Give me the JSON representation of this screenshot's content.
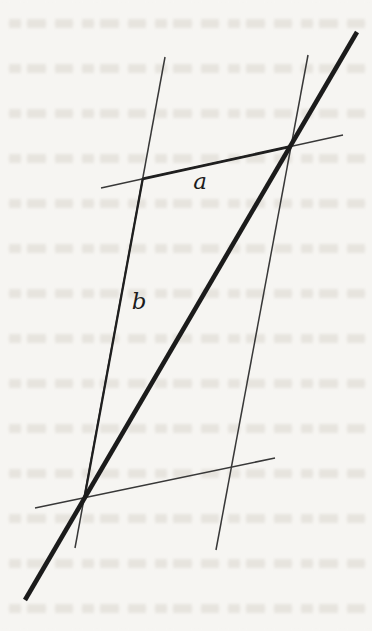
{
  "figure": {
    "paper_color": "#f6f5f2",
    "ink_color": "#1f1f1f",
    "thin_ink_color": "#383838",
    "lines": [
      {
        "name": "thin-parallel-line-left",
        "x1": 165,
        "y1": 57,
        "x2": 75,
        "y2": 548,
        "width": 1.5,
        "color": "#383838"
      },
      {
        "name": "thin-parallel-line-right",
        "x1": 308,
        "y1": 55,
        "x2": 216,
        "y2": 550,
        "width": 1.5,
        "color": "#383838"
      },
      {
        "name": "thin-transversal-top",
        "x1": 101,
        "y1": 188,
        "x2": 343,
        "y2": 135,
        "width": 1.4,
        "color": "#383838"
      },
      {
        "name": "thin-transversal-bottom",
        "x1": 35,
        "y1": 508,
        "x2": 275,
        "y2": 458,
        "width": 1.5,
        "color": "#383838"
      },
      {
        "name": "segment-a",
        "x1": 142.7,
        "y1": 178.9,
        "x2": 291,
        "y2": 146.4,
        "width": 2.8,
        "color": "#1f1f1f"
      },
      {
        "name": "segment-b",
        "x1": 142.8,
        "y1": 178.5,
        "x2": 84.4,
        "y2": 497.8,
        "width": 2.3,
        "color": "#1f1f1f"
      },
      {
        "name": "main-thick-diagonal",
        "x1": 25,
        "y1": 600,
        "x2": 357,
        "y2": 32,
        "width": 4.6,
        "color": "#1b1b1b"
      }
    ],
    "labels": [
      {
        "name": "label-a",
        "text": "a",
        "x": 200,
        "y": 181
      },
      {
        "name": "label-b",
        "text": "b",
        "x": 139,
        "y": 301
      }
    ]
  }
}
